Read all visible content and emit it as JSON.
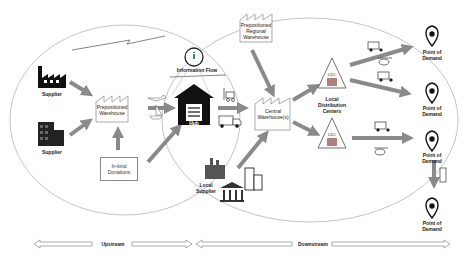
{
  "nodes": {
    "supplier_top": "Supplier",
    "supplier_bottom": "Supplier",
    "prepositioned_warehouse": "Prepositioned Warehouse",
    "inkind_donations": "In-kind Donations",
    "information_flow": "Information Flow",
    "info_icon": "i",
    "hub": "Hub",
    "prepositioned_regional_warehouse": "Prepositioned Regional Warehouse",
    "central_warehouse": "Central Warehouse(s)",
    "local_supplier": "Local Supplier",
    "ldc_top": "LDC",
    "ldc_bottom": "LDC",
    "local_distribution_centers": "Local Distribution Centers",
    "pod_1": "Point of Demand",
    "pod_2": "Point of Demand",
    "pod_3": "Point of Demand",
    "pod_4": "Point of Demand"
  },
  "bottom_axis": {
    "upstream": "Upstream",
    "downstream": "Downstream"
  },
  "colors": {
    "arrow": "#8a8a8a",
    "ellipse": "#999999",
    "icon": "#111111"
  }
}
